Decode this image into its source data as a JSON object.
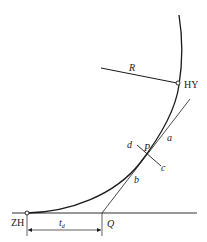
{
  "diagram": {
    "type": "transition-curve-geometry",
    "colors": {
      "line": "#1a1a1a",
      "background": "#ffffff"
    },
    "points": {
      "zh": {
        "label": "ZH",
        "x": 27,
        "y": 213
      },
      "hy": {
        "label": "HY",
        "x": 178,
        "y": 83
      },
      "p": {
        "label": "P",
        "x": 147,
        "y": 153
      },
      "q": {
        "label": "Q",
        "x": 102,
        "y": 213
      }
    },
    "labels": {
      "radius": "R",
      "tangent_upper": "a",
      "tangent_lower": "b",
      "normal_lower": "c",
      "normal_upper": "d",
      "distance_main": "t",
      "distance_sub": "d"
    },
    "elements": [
      "curve from ZH through P and HY",
      "radius line R ending at HY",
      "tangent line a–b through P meeting baseline at Q",
      "normal line d–c through P",
      "baseline through ZH and Q",
      "dimension t_d between ZH and Q"
    ]
  }
}
